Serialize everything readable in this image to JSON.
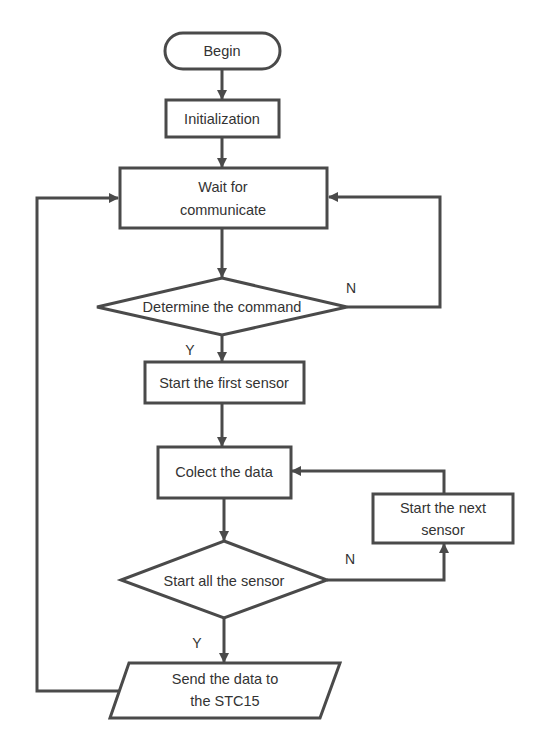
{
  "diagram": {
    "type": "flowchart",
    "stroke_color": "#4a4a4a",
    "text_color": "#333333",
    "nodes": [
      {
        "id": "begin",
        "shape": "terminator",
        "label": "Begin"
      },
      {
        "id": "init",
        "shape": "process",
        "label": "Initialization"
      },
      {
        "id": "wait",
        "shape": "process",
        "label_line1": "Wait for",
        "label_line2": "communicate"
      },
      {
        "id": "determine",
        "shape": "decision",
        "label": "Determine the command"
      },
      {
        "id": "first_sensor",
        "shape": "process",
        "label": "Start the first sensor"
      },
      {
        "id": "collect",
        "shape": "process",
        "label": "Colect the data"
      },
      {
        "id": "next_sensor",
        "shape": "process",
        "label_line1": "Start the next",
        "label_line2": "sensor"
      },
      {
        "id": "all_sensor",
        "shape": "decision",
        "label": "Start all the sensor"
      },
      {
        "id": "send",
        "shape": "io",
        "label_line1": "Send the data to",
        "label_line2": "the STC15"
      }
    ],
    "edges": [
      {
        "from": "begin",
        "to": "init",
        "label": ""
      },
      {
        "from": "init",
        "to": "wait",
        "label": ""
      },
      {
        "from": "wait",
        "to": "determine",
        "label": ""
      },
      {
        "from": "determine",
        "to": "wait",
        "label": "N"
      },
      {
        "from": "determine",
        "to": "first_sensor",
        "label": "Y"
      },
      {
        "from": "first_sensor",
        "to": "collect",
        "label": ""
      },
      {
        "from": "collect",
        "to": "all_sensor",
        "label": ""
      },
      {
        "from": "all_sensor",
        "to": "next_sensor",
        "label": "N"
      },
      {
        "from": "next_sensor",
        "to": "collect",
        "label": ""
      },
      {
        "from": "all_sensor",
        "to": "send",
        "label": "Y"
      },
      {
        "from": "send",
        "to": "wait",
        "label": ""
      }
    ],
    "edge_labels": {
      "n1": "N",
      "y1": "Y",
      "n2": "N",
      "y2": "Y"
    }
  }
}
